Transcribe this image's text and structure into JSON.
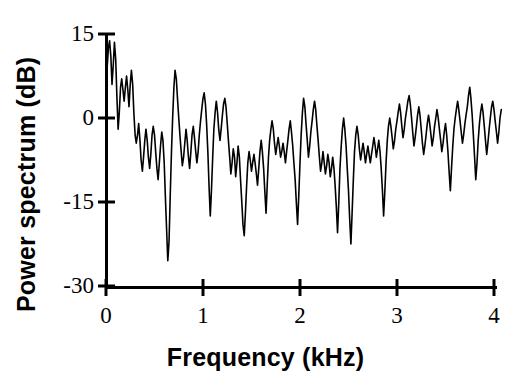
{
  "chart_data": {
    "type": "line",
    "title": "",
    "subtitle": "",
    "xlabel": "Frequency (kHz)",
    "ylabel": "Power spectrum (dB)",
    "xlim": [
      0,
      4.1
    ],
    "ylim": [
      -30,
      15
    ],
    "xticks": [
      0,
      1,
      2,
      3,
      4
    ],
    "xtick_labels": [
      "0",
      "1",
      "2",
      "3",
      "4"
    ],
    "yticks": [
      15,
      0,
      -15,
      -30
    ],
    "ytick_labels": [
      "15",
      "0",
      "-15",
      "-30"
    ],
    "grid": false,
    "legend": null,
    "annotations": [],
    "line_color": "#000000",
    "line_width": 1.6,
    "series": [
      {
        "name": "power spectrum",
        "x": [
          0.0,
          0.012,
          0.025,
          0.037,
          0.05,
          0.062,
          0.075,
          0.087,
          0.1,
          0.112,
          0.125,
          0.137,
          0.15,
          0.162,
          0.175,
          0.187,
          0.2,
          0.212,
          0.225,
          0.237,
          0.25,
          0.262,
          0.275,
          0.287,
          0.3,
          0.312,
          0.325,
          0.337,
          0.35,
          0.362,
          0.375,
          0.387,
          0.4,
          0.412,
          0.425,
          0.437,
          0.45,
          0.462,
          0.475,
          0.487,
          0.5,
          0.512,
          0.525,
          0.537,
          0.55,
          0.562,
          0.575,
          0.587,
          0.6,
          0.612,
          0.625,
          0.637,
          0.65,
          0.662,
          0.675,
          0.687,
          0.7,
          0.712,
          0.725,
          0.737,
          0.75,
          0.762,
          0.775,
          0.787,
          0.8,
          0.812,
          0.825,
          0.837,
          0.85,
          0.862,
          0.875,
          0.887,
          0.9,
          0.912,
          0.925,
          0.937,
          0.95,
          0.962,
          0.975,
          0.987,
          1.0,
          1.012,
          1.025,
          1.037,
          1.05,
          1.062,
          1.075,
          1.087,
          1.1,
          1.112,
          1.125,
          1.137,
          1.15,
          1.162,
          1.175,
          1.187,
          1.2,
          1.212,
          1.225,
          1.237,
          1.25,
          1.262,
          1.275,
          1.287,
          1.3,
          1.312,
          1.325,
          1.337,
          1.35,
          1.362,
          1.375,
          1.387,
          1.4,
          1.412,
          1.425,
          1.437,
          1.45,
          1.462,
          1.475,
          1.487,
          1.5,
          1.512,
          1.525,
          1.537,
          1.55,
          1.562,
          1.575,
          1.587,
          1.6,
          1.612,
          1.625,
          1.637,
          1.65,
          1.662,
          1.675,
          1.687,
          1.7,
          1.712,
          1.725,
          1.737,
          1.75,
          1.762,
          1.775,
          1.787,
          1.8,
          1.812,
          1.825,
          1.837,
          1.85,
          1.862,
          1.875,
          1.887,
          1.9,
          1.912,
          1.925,
          1.937,
          1.95,
          1.962,
          1.975,
          1.987,
          2.0,
          2.012,
          2.025,
          2.037,
          2.05,
          2.062,
          2.075,
          2.087,
          2.1,
          2.112,
          2.125,
          2.137,
          2.15,
          2.162,
          2.175,
          2.187,
          2.2,
          2.212,
          2.225,
          2.237,
          2.25,
          2.262,
          2.275,
          2.287,
          2.3,
          2.312,
          2.325,
          2.337,
          2.35,
          2.362,
          2.375,
          2.387,
          2.4,
          2.412,
          2.425,
          2.437,
          2.45,
          2.462,
          2.475,
          2.487,
          2.5,
          2.512,
          2.525,
          2.537,
          2.55,
          2.562,
          2.575,
          2.587,
          2.6,
          2.612,
          2.625,
          2.637,
          2.65,
          2.662,
          2.675,
          2.687,
          2.7,
          2.712,
          2.725,
          2.737,
          2.75,
          2.762,
          2.775,
          2.787,
          2.8,
          2.812,
          2.825,
          2.837,
          2.85,
          2.862,
          2.875,
          2.887,
          2.9,
          2.912,
          2.925,
          2.937,
          2.95,
          2.962,
          2.975,
          2.987,
          3.0,
          3.012,
          3.025,
          3.037,
          3.05,
          3.062,
          3.075,
          3.087,
          3.1,
          3.112,
          3.125,
          3.137,
          3.15,
          3.162,
          3.175,
          3.187,
          3.2,
          3.212,
          3.225,
          3.237,
          3.25,
          3.262,
          3.275,
          3.287,
          3.3,
          3.312,
          3.325,
          3.337,
          3.35,
          3.362,
          3.375,
          3.387,
          3.4,
          3.412,
          3.425,
          3.437,
          3.45,
          3.462,
          3.475,
          3.487,
          3.5,
          3.512,
          3.525,
          3.537,
          3.55,
          3.562,
          3.575,
          3.587,
          3.6,
          3.612,
          3.625,
          3.637,
          3.65,
          3.662,
          3.675,
          3.687,
          3.7,
          3.712,
          3.725,
          3.737,
          3.75,
          3.762,
          3.775,
          3.787,
          3.8,
          3.812,
          3.825,
          3.837,
          3.85,
          3.862,
          3.875,
          3.887,
          3.9,
          3.912,
          3.925,
          3.937,
          3.95,
          3.962,
          3.975,
          3.987,
          4.0,
          4.012,
          4.025,
          4.037,
          4.05,
          4.062,
          4.075
        ],
        "y": [
          5.0,
          9.0,
          12.5,
          13.8,
          11.0,
          6.0,
          9.5,
          13.5,
          10.5,
          4.0,
          -2.0,
          1.0,
          5.5,
          7.0,
          5.0,
          3.0,
          5.5,
          7.5,
          5.0,
          2.0,
          6.0,
          8.5,
          6.0,
          1.0,
          -3.0,
          -4.5,
          -3.0,
          -1.0,
          -4.0,
          -7.5,
          -9.5,
          -7.0,
          -4.0,
          -2.0,
          -4.0,
          -7.0,
          -9.0,
          -6.5,
          -3.0,
          -1.5,
          -3.0,
          -6.0,
          -9.0,
          -11.0,
          -8.0,
          -5.0,
          -2.5,
          -4.0,
          -8.0,
          -14.0,
          -20.0,
          -25.5,
          -22.0,
          -14.0,
          -6.0,
          0.0,
          5.5,
          8.5,
          7.0,
          3.5,
          0.0,
          -3.0,
          -6.0,
          -8.5,
          -7.0,
          -4.5,
          -2.0,
          -4.0,
          -7.0,
          -9.0,
          -6.0,
          -3.0,
          -1.5,
          -3.5,
          -6.0,
          -8.0,
          -6.0,
          -3.0,
          -0.5,
          1.5,
          3.5,
          4.5,
          2.5,
          -1.0,
          -6.0,
          -12.0,
          -17.5,
          -13.0,
          -7.0,
          -2.0,
          1.0,
          3.0,
          1.0,
          -2.0,
          -4.0,
          -2.0,
          0.5,
          2.5,
          3.5,
          2.0,
          -1.0,
          -4.0,
          -7.0,
          -10.0,
          -8.0,
          -5.5,
          -7.0,
          -10.5,
          -8.0,
          -5.0,
          -7.0,
          -11.0,
          -15.0,
          -19.0,
          -21.0,
          -17.0,
          -12.0,
          -8.0,
          -6.0,
          -7.5,
          -9.5,
          -8.0,
          -6.5,
          -8.0,
          -10.0,
          -12.0,
          -9.0,
          -6.0,
          -4.0,
          -6.0,
          -9.0,
          -13.0,
          -17.0,
          -12.0,
          -7.0,
          -4.0,
          -2.0,
          -0.5,
          -2.0,
          -4.5,
          -6.5,
          -5.0,
          -3.5,
          -5.0,
          -7.0,
          -6.0,
          -4.5,
          -6.0,
          -8.0,
          -6.0,
          -4.0,
          -2.0,
          -0.5,
          -2.5,
          -5.0,
          -8.0,
          -11.0,
          -15.0,
          -19.0,
          -14.0,
          -8.0,
          -3.0,
          1.0,
          3.5,
          2.0,
          -1.0,
          -4.0,
          -7.0,
          -5.0,
          -2.5,
          -0.5,
          1.5,
          3.0,
          1.5,
          -1.5,
          -4.0,
          -7.0,
          -9.5,
          -8.0,
          -6.0,
          -8.0,
          -10.0,
          -8.5,
          -6.5,
          -8.0,
          -10.5,
          -9.0,
          -7.0,
          -9.0,
          -12.0,
          -16.0,
          -20.5,
          -15.0,
          -9.0,
          -5.0,
          -2.0,
          0.0,
          -2.0,
          -5.0,
          -9.0,
          -13.0,
          -18.0,
          -22.5,
          -17.0,
          -11.0,
          -6.0,
          -3.0,
          -1.5,
          -3.0,
          -5.5,
          -7.5,
          -6.0,
          -4.5,
          -6.0,
          -8.0,
          -6.5,
          -5.0,
          -6.5,
          -8.0,
          -6.5,
          -5.0,
          -3.5,
          -5.0,
          -7.0,
          -5.5,
          -4.0,
          -6.0,
          -9.0,
          -13.0,
          -17.5,
          -13.0,
          -8.0,
          -4.0,
          -1.5,
          0.0,
          -1.5,
          -3.5,
          -5.5,
          -4.0,
          -2.0,
          -0.5,
          1.0,
          2.5,
          1.0,
          -1.5,
          -3.5,
          -2.0,
          0.0,
          1.5,
          3.0,
          4.0,
          2.5,
          0.0,
          -2.5,
          -5.0,
          -3.5,
          -1.5,
          0.5,
          2.0,
          0.5,
          -2.0,
          -4.5,
          -6.5,
          -5.0,
          -3.0,
          -1.0,
          0.5,
          -1.0,
          -3.0,
          -5.0,
          -3.5,
          -1.5,
          0.0,
          1.5,
          0.0,
          -2.0,
          -4.0,
          -6.0,
          -4.5,
          -2.5,
          -1.0,
          -3.0,
          -6.0,
          -9.5,
          -13.0,
          -9.0,
          -5.0,
          -2.0,
          0.0,
          1.5,
          3.0,
          1.5,
          -0.5,
          -2.5,
          -4.5,
          -3.0,
          -1.0,
          0.5,
          2.0,
          4.0,
          5.5,
          3.5,
          0.5,
          -3.0,
          -7.0,
          -11.0,
          -8.0,
          -4.0,
          -1.0,
          1.0,
          2.5,
          1.0,
          -1.5,
          -4.0,
          -6.5,
          -4.5,
          -2.0,
          0.0,
          2.0,
          3.0,
          1.5,
          -0.5,
          -2.5,
          -4.5,
          -2.5,
          0.0,
          1.5
        ]
      }
    ]
  },
  "axes": {
    "x_title": "Frequency (kHz)",
    "y_title": "Power spectrum (dB)",
    "x_tick_labels": [
      "0",
      "1",
      "2",
      "3",
      "4"
    ],
    "y_tick_labels": [
      "15",
      "0",
      "-15",
      "-30"
    ]
  },
  "colors": {
    "background": "#ffffff",
    "foreground": "#000000",
    "trace": "#000000"
  }
}
